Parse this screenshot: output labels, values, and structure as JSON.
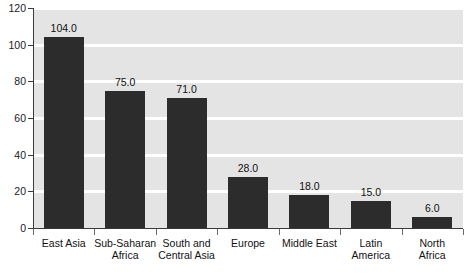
{
  "chart_data": {
    "type": "bar",
    "title": "",
    "subtitle": "",
    "xlabel": "",
    "ylabel": "",
    "categories": [
      "East Asia",
      "Sub-Saharan Africa",
      "South and Central Asia",
      "Europe",
      "Middle East",
      "Latin America",
      "North Africa"
    ],
    "category_lines": [
      [
        "East Asia",
        ""
      ],
      [
        "Sub-Saharan",
        "Africa"
      ],
      [
        "South and",
        "Central Asia"
      ],
      [
        "Europe",
        ""
      ],
      [
        "Middle East",
        ""
      ],
      [
        "Latin",
        "America"
      ],
      [
        "North",
        "Africa"
      ]
    ],
    "values": [
      104.0,
      75.0,
      71.0,
      28.0,
      18.0,
      15.0,
      6.0
    ],
    "value_labels": [
      "104.0",
      "75.0",
      "71.0",
      "28.0",
      "18.0",
      "15.0",
      "6.0"
    ],
    "ylim": [
      0,
      120
    ],
    "yticks": [
      0,
      20,
      40,
      60,
      80,
      100,
      120
    ],
    "ytick_labels": [
      "0",
      "20",
      "40",
      "60",
      "80",
      "100",
      "120"
    ],
    "grid": "horizontal",
    "legend": "none",
    "colors": {
      "bar": "#2c2c2c",
      "plot_background": "#e4e4e4",
      "gridline": "#ffffff",
      "axis": "#3a3a3a",
      "text": "#111111",
      "page_background": "#ffffff"
    }
  }
}
